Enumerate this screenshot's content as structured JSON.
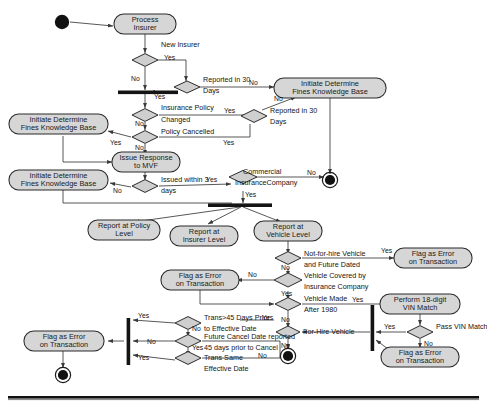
{
  "diagram": {
    "kind": "uml-activity-diagram",
    "colors": {
      "activity_fill": "#d6d6d6",
      "decision_fill": "#cfcfcf",
      "stroke": "#2a2a2a",
      "node_fill": "#111111",
      "background": "#ffffff"
    },
    "activities": [
      {
        "id": "process_insurer",
        "label": "Process\nInsurer",
        "line1": "Process",
        "line2": "Insurer"
      },
      {
        "id": "initiate_1",
        "label": "Initiate Determine\nFines Knowledge Base",
        "line1": "Initiate Determine",
        "line2": "Fines Knowledge Base"
      },
      {
        "id": "initiate_2",
        "label": "Initiate Determine\nFines Knowledge Base",
        "line1": "Initiate Determine",
        "line2": "Fines Knowledge Base"
      },
      {
        "id": "initiate_3",
        "label": "Initiate Determine\nFines Knowledge Base",
        "line1": "Initiate Determine",
        "line2": "Fines Knowledge Base"
      },
      {
        "id": "issue_response",
        "label": "Issue Response\nto MVF",
        "line1": "Issue Response",
        "line2": "to MVF"
      },
      {
        "id": "report_policy",
        "label": "Report at Policy\nLevel",
        "line1": "Report at Policy",
        "line2": "Level"
      },
      {
        "id": "report_insurer",
        "label": "Report at\nInsurer Level",
        "line1": "Report at",
        "line2": "Insurer Level"
      },
      {
        "id": "report_vehicle",
        "label": "Report at\nVehicle Level",
        "line1": "Report at",
        "line2": "Vehicle Level"
      },
      {
        "id": "flag_error_1",
        "label": "Flag as Error\non Transaction",
        "line1": "Flag as Error",
        "line2": "on Transaction"
      },
      {
        "id": "flag_error_2",
        "label": "Flag as Error\non Transaction",
        "line1": "Flag as Error",
        "line2": "on Transaction"
      },
      {
        "id": "perform_vin",
        "label": "Perform 18-digit\nVIN Match",
        "line1": "Perform 18-digit",
        "line2": "VIN Match"
      },
      {
        "id": "flag_error_3",
        "label": "Flag as Error\non Transaction",
        "line1": "Flag as Error",
        "line2": "on Transaction"
      },
      {
        "id": "flag_error_4",
        "label": "Flag as Error\non Transaction",
        "line1": "Flag as Error",
        "line2": "on Transaction"
      }
    ],
    "decisions": [
      {
        "id": "new_insurer",
        "line1": "New Insurer",
        "line2": ""
      },
      {
        "id": "reported_30_a",
        "line1": "Reported in 30",
        "line2": "Days"
      },
      {
        "id": "insurance_policy",
        "line1": "Insurance Policy",
        "line2": "Changed"
      },
      {
        "id": "policy_cancelled",
        "line1": "Policy Cancelled",
        "line2": ""
      },
      {
        "id": "reported_30_b",
        "line1": "Reported in 30",
        "line2": "Days"
      },
      {
        "id": "issued_3_days",
        "line1": "Issued within 3",
        "line2": "days"
      },
      {
        "id": "commercial_ins",
        "line1": "Commercial",
        "line2": "InsuranceCompany"
      },
      {
        "id": "not_for_hire",
        "line1": "Not-for-hire Vehicle",
        "line2": "and Future Dated"
      },
      {
        "id": "vehicle_covered",
        "line1": "Vehicle Covered by",
        "line2": "Insurance Company"
      },
      {
        "id": "vehicle_made",
        "line1": "Vehicle Made",
        "line2": "After 1980"
      },
      {
        "id": "for_hire_vehicle",
        "line1": "For-Hire Vehicle",
        "line2": ""
      },
      {
        "id": "pass_vin_match",
        "line1": "Pass VIN Match",
        "line2": ""
      },
      {
        "id": "trans_45_days",
        "line1": "Trans>45 Days Prior",
        "line2": "to Effective Date"
      },
      {
        "id": "future_cancel",
        "line1": "Future Cancel Date reported",
        "line2": "45 days prior to Cancel"
      },
      {
        "id": "trans_same",
        "line1": "Trans Same",
        "line2": "Effective Date"
      }
    ],
    "guards": {
      "yes": "Yes",
      "no": "No"
    },
    "edge_labels": [
      "Yes",
      "No",
      "Yes",
      "No",
      "Yes",
      "No",
      "Yes",
      "No",
      "Yes",
      "No",
      "Yes",
      "No",
      "Yes",
      "No",
      "Yes",
      "No",
      "Yes",
      "No",
      "Yes",
      "No",
      "Yes",
      "No",
      "Yes",
      "No",
      "Yes",
      "No"
    ],
    "nodes": {
      "start": "initial-node",
      "end_1": "final-node",
      "end_2": "final-node",
      "end_3": "final-node"
    },
    "bars": {
      "merge_top": "horizontal-synchronization-bar",
      "fork_middle": "horizontal-synchronization-bar",
      "join_left": "vertical-synchronization-bar",
      "join_right": "vertical-synchronization-bar"
    }
  }
}
